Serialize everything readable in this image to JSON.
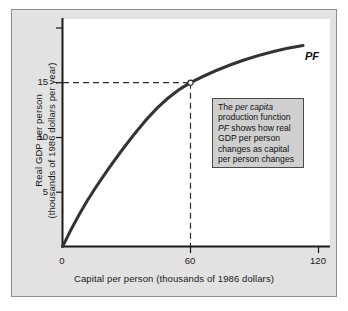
{
  "figure": {
    "panel_background": "#e2e2e2",
    "plot_background": "#ffffff",
    "border_color": "#8d8d8d"
  },
  "chart_data": {
    "type": "line",
    "title": "",
    "subtitle": "",
    "xlabel": "Capital per person (thousands of 1986 dollars)",
    "ylabel_line1": "Real GDP per person",
    "ylabel_line2": "(thousands of 1986 dollars per year)",
    "xlim": [
      0,
      126
    ],
    "ylim": [
      0,
      20.8
    ],
    "xticks": [
      0,
      60,
      120
    ],
    "xtick_labels": [
      "0",
      "60",
      "120"
    ],
    "yticks": [
      5,
      10,
      15,
      20
    ],
    "ytick_labels": [
      "5",
      "10",
      "15",
      ""
    ],
    "grid": false,
    "legend_position": "none",
    "series": [
      {
        "name": "PF",
        "label": "PF",
        "label_style": "italic",
        "color": "#333333",
        "x": [
          0,
          5,
          10,
          15,
          20,
          25,
          30,
          35,
          40,
          45,
          50,
          55,
          60,
          65,
          70,
          75,
          80,
          85,
          90,
          95,
          100,
          105,
          110,
          113
        ],
        "values": [
          0,
          2.15,
          4.05,
          5.7,
          7.15,
          8.45,
          9.6,
          10.6,
          11.5,
          12.3,
          13.05,
          13.7,
          15.0,
          15.45,
          15.85,
          16.25,
          16.6,
          16.95,
          17.25,
          17.5,
          17.75,
          18.0,
          18.3,
          18.5
        ]
      }
    ],
    "annotations": [
      {
        "name": "reference-point",
        "x": 60,
        "y": 15,
        "marker": "open-circle",
        "dashed_guides": [
          "horizontal-to-y-axis",
          "vertical-to-x-axis"
        ]
      }
    ],
    "textbox": {
      "lines": [
        {
          "parts": [
            {
              "t": "The ",
              "i": false
            },
            {
              "t": "per capita",
              "i": true
            }
          ]
        },
        {
          "parts": [
            {
              "t": "production function",
              "i": false
            }
          ]
        },
        {
          "parts": [
            {
              "t": "PF",
              "i": true
            },
            {
              "t": " shows how real",
              "i": false
            }
          ]
        },
        {
          "parts": [
            {
              "t": "GDP per person",
              "i": false
            }
          ]
        },
        {
          "parts": [
            {
              "t": "changes as capital",
              "i": false
            }
          ]
        },
        {
          "parts": [
            {
              "t": "per person changes",
              "i": false
            }
          ]
        }
      ],
      "background": "#cfcfcf",
      "border": "#4a4a4a"
    },
    "curve_label": "PF"
  }
}
